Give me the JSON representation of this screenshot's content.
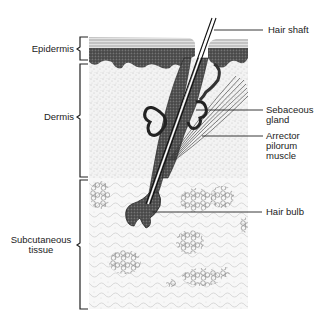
{
  "diagram": {
    "layers": [
      {
        "id": "epidermis",
        "label": "Epidermis",
        "bracket_top": 37,
        "bracket_bottom": 60
      },
      {
        "id": "dermis",
        "label": "Dermis",
        "bracket_top": 64,
        "bracket_bottom": 177
      },
      {
        "id": "subcutaneous",
        "label_line1": "Subcutaneous",
        "label_line2": "tissue",
        "bracket_top": 180,
        "bracket_bottom": 309
      }
    ],
    "callouts": [
      {
        "id": "hair-shaft",
        "lines": [
          "Hair shaft"
        ]
      },
      {
        "id": "sebaceous-gland",
        "lines": [
          "Sebaceous",
          "gland"
        ]
      },
      {
        "id": "arrector-pilorum",
        "lines": [
          "Arrector",
          "pilorum",
          "muscle"
        ]
      },
      {
        "id": "hair-bulb",
        "lines": [
          "Hair bulb"
        ]
      }
    ],
    "colors": {
      "ink": "#1a1a1a",
      "stipple": "#9a9a9a",
      "background": "#ffffff",
      "epidermis_dark": "#3a3a3a",
      "dermis_fill": "#f1f1f1",
      "subcut_fill": "#f6f6f6"
    }
  }
}
